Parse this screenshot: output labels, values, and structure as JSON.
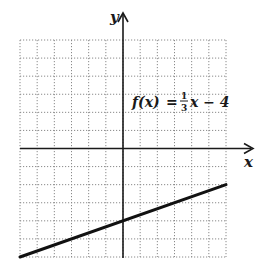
{
  "chart_data": {
    "type": "line",
    "title": "",
    "function_label": {
      "lhs": "f(x)",
      "equals": "=",
      "frac_num": "1",
      "frac_den": "3",
      "rest": "x − 4"
    },
    "xlabel": "x",
    "ylabel": "y",
    "xlim": [
      -6,
      6
    ],
    "ylim": [
      -6,
      6
    ],
    "grid": true,
    "grid_step": 1,
    "series": [
      {
        "name": "f(x) = (1/3)x − 4",
        "x": [
          -6,
          6
        ],
        "y": [
          -6,
          -2
        ]
      }
    ],
    "y_intercept": -4,
    "slope": 0.3333
  },
  "colors": {
    "axis": "#1a1a1a",
    "grid": "#8a8a8a",
    "line": "#111111",
    "background": "#ffffff"
  }
}
